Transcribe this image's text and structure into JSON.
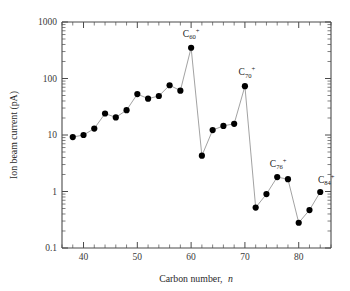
{
  "chart_data": {
    "type": "line",
    "title": "",
    "xlabel": "Carbon number, n",
    "ylabel": "Ion beam current (pA)",
    "xlabel_plain": "Carbon number,",
    "xlabel_italic": "n",
    "xlim": [
      36,
      86
    ],
    "ylim": [
      0.1,
      1000
    ],
    "yscale": "log",
    "xscale": "linear",
    "grid": false,
    "legend": null,
    "x_major_ticks": [
      40,
      50,
      60,
      70,
      80
    ],
    "x_major_tick_labels": [
      "40",
      "50",
      "60",
      "70",
      "80"
    ],
    "x_minor_tick_step": 2,
    "y_major_ticks": [
      0.1,
      1,
      10,
      100,
      1000
    ],
    "y_major_tick_labels": [
      "0.1",
      "1",
      "10",
      "100",
      "1000"
    ],
    "marker": "filled-circle",
    "marker_color": "#000000",
    "line_color": "#8a8a8a",
    "x": [
      38,
      40,
      42,
      44,
      46,
      48,
      50,
      52,
      54,
      56,
      58,
      60,
      62,
      64,
      66,
      68,
      70,
      72,
      74,
      76,
      78,
      80,
      82,
      84
    ],
    "values": [
      9.2,
      10.0,
      13.0,
      24.0,
      20.5,
      27.5,
      53.0,
      44.0,
      49.0,
      76.0,
      61.0,
      350.0,
      4.3,
      12.2,
      14.5,
      15.8,
      73.0,
      0.52,
      0.9,
      1.8,
      1.65,
      0.28,
      0.47,
      0.98
    ],
    "annotations": [
      {
        "x": 60,
        "value": 350.0,
        "base": "C",
        "sub": "60",
        "sup": "+",
        "text": "C60+"
      },
      {
        "x": 70,
        "value": 73.0,
        "base": "C",
        "sub": "70",
        "sup": "+",
        "text": "C70+"
      },
      {
        "x": 76,
        "value": 1.8,
        "base": "C",
        "sub": "76",
        "sup": "+",
        "text": "C76+"
      },
      {
        "x": 84,
        "value": 0.98,
        "base": "C",
        "sub": "84",
        "sup": "+",
        "text": "C84+"
      }
    ]
  },
  "figure": {
    "background": "#ffffff",
    "axis_color": "#4a4a4a",
    "text_color": "#1a1a1a"
  }
}
